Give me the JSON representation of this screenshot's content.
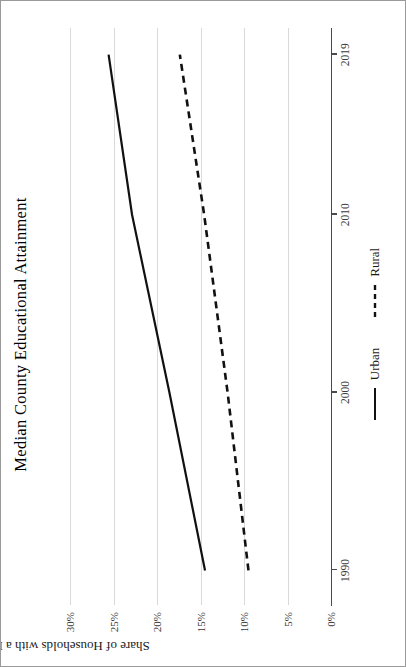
{
  "chart_data": {
    "type": "line",
    "title": "Median County Educational Attainment",
    "xlabel": "",
    "ylabel": "Share of Households with a BA or Above",
    "x": [
      1990,
      2000,
      2010,
      2019
    ],
    "xlim": [
      1988,
      2020.5
    ],
    "ylim": [
      0,
      32
    ],
    "grid": true,
    "legend_position": "bottom",
    "xticks": [
      1990,
      2000,
      2010,
      2019
    ],
    "xtick_labels": [
      "1990",
      "2000",
      "2010",
      "2019"
    ],
    "yticks": [
      0,
      5,
      10,
      15,
      20,
      25,
      30
    ],
    "ytick_labels": [
      "0%",
      "5%",
      "10%",
      "15%",
      "20%",
      "25%",
      "30%"
    ],
    "series": [
      {
        "name": "Urban",
        "style": "solid",
        "color": "#111111",
        "values": [
          14.5,
          18.6,
          22.9,
          25.6
        ]
      },
      {
        "name": "Rural",
        "style": "dashed",
        "color": "#111111",
        "values": [
          9.5,
          11.9,
          14.6,
          17.4
        ]
      }
    ]
  },
  "legend": {
    "items": [
      {
        "label": "Urban",
        "style": "solid"
      },
      {
        "label": "Rural",
        "style": "dashed"
      }
    ]
  }
}
